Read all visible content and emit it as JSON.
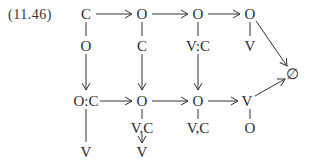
{
  "equation_label": "(11.46)",
  "colors": {
    "ink": "#2a2a2a",
    "line": "#333333",
    "background": "#ffffff"
  },
  "nodes": {
    "r1c1": {
      "text": "C",
      "x": 86,
      "y": 14
    },
    "r1c2": {
      "text": "O",
      "x": 142,
      "y": 14
    },
    "r1c3": {
      "text": "O",
      "x": 198,
      "y": 14
    },
    "r1c4": {
      "text": "O",
      "x": 250,
      "y": 14
    },
    "r2c1": {
      "text": "O",
      "x": 86,
      "y": 46
    },
    "r2c2": {
      "text": "C",
      "x": 142,
      "y": 46
    },
    "r2c3": {
      "text": "V:C",
      "x": 198,
      "y": 46
    },
    "r2c4": {
      "text": "V",
      "x": 250,
      "y": 46
    },
    "r3c1": {
      "text": "O:C",
      "x": 86,
      "y": 101
    },
    "r3c2": {
      "text": "O",
      "x": 142,
      "y": 101
    },
    "r3c3": {
      "text": "O",
      "x": 198,
      "y": 101
    },
    "r3c4": {
      "text": "V",
      "x": 247,
      "y": 101
    },
    "r4c2": {
      "text": "V,C",
      "x": 142,
      "y": 128
    },
    "r4c3": {
      "text": "V,C",
      "x": 198,
      "y": 128
    },
    "r4c4": {
      "text": "O",
      "x": 250,
      "y": 128
    },
    "r5c1": {
      "text": "V",
      "x": 86,
      "y": 152
    },
    "r5c2": {
      "text": "V",
      "x": 142,
      "y": 152
    },
    "empty": {
      "text": "∅",
      "x": 292,
      "y": 74
    }
  },
  "edges": [
    {
      "from": "r1c1",
      "to": "r1c2",
      "type": "arrow"
    },
    {
      "from": "r1c2",
      "to": "r1c3",
      "type": "arrow"
    },
    {
      "from": "r1c3",
      "to": "r1c4",
      "type": "arrow"
    },
    {
      "from": "r1c1",
      "to": "r2c1",
      "type": "line"
    },
    {
      "from": "r1c2",
      "to": "r2c2",
      "type": "line"
    },
    {
      "from": "r1c3",
      "to": "r2c3",
      "type": "line"
    },
    {
      "from": "r1c4",
      "to": "r2c4",
      "type": "line"
    },
    {
      "from": "r2c1",
      "to": "r3c1",
      "type": "arrow"
    },
    {
      "from": "r2c2",
      "to": "r3c2",
      "type": "arrow"
    },
    {
      "from": "r2c3",
      "to": "r3c3",
      "type": "arrow"
    },
    {
      "from": "r1c4",
      "to": "empty",
      "type": "arrow"
    },
    {
      "from": "r3c1",
      "to": "r3c2",
      "type": "arrow"
    },
    {
      "from": "r3c2",
      "to": "r3c3",
      "type": "arrow"
    },
    {
      "from": "r3c3",
      "to": "r3c4",
      "type": "arrow"
    },
    {
      "from": "r3c4",
      "to": "empty",
      "type": "arrow"
    },
    {
      "from": "r3c1",
      "to": "r5c1",
      "type": "line"
    },
    {
      "from": "r3c2",
      "to": "r4c2",
      "type": "line"
    },
    {
      "from": "r3c3",
      "to": "r4c3",
      "type": "line"
    },
    {
      "from": "r3c4",
      "to": "r4c4",
      "type": "line"
    },
    {
      "from": "r4c2",
      "to": "r5c2",
      "type": "arrow"
    }
  ]
}
